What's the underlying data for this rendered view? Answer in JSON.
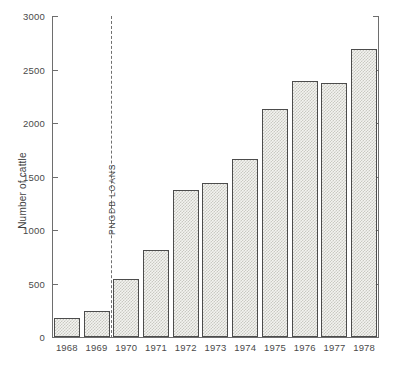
{
  "chart_data": {
    "type": "bar",
    "title": "",
    "xlabel": "",
    "ylabel": "Number of cattle",
    "categories": [
      "1968",
      "1969",
      "1970",
      "1971",
      "1972",
      "1973",
      "1974",
      "1975",
      "1976",
      "1977",
      "1978"
    ],
    "values": [
      180,
      240,
      540,
      810,
      1370,
      1440,
      1660,
      2130,
      2390,
      2370,
      2690
    ],
    "ylim": [
      0,
      3000
    ],
    "ytick_labels": [
      "0",
      "500",
      "1000",
      "1500",
      "2000",
      "2500",
      "3000"
    ],
    "ytick_values": [
      0,
      500,
      1000,
      1500,
      2000,
      2500,
      3000
    ],
    "grid": false,
    "legend": "none",
    "annotations": [
      {
        "text": "PNGDB LOANS",
        "kind": "vertical-dashed-line",
        "position_between": [
          "1969",
          "1970"
        ],
        "orientation": "rotated-90"
      }
    ],
    "axes": {
      "left_axis": true,
      "right_axis": true,
      "right_axis_labeled": false,
      "tick_direction": "inward"
    },
    "style": {
      "bar_fill": "#f3f3f0",
      "bar_pattern": "#c9c9c2",
      "bar_outline": "#4c4c4c",
      "axis_color": "#6e6e6e",
      "text_color": "#4a4a4a",
      "background": "#ffffff"
    }
  }
}
